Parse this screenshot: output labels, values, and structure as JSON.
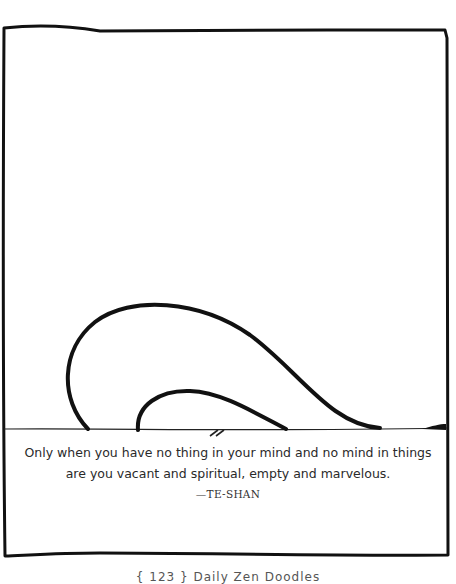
{
  "panel": {
    "quote_line_1": "Only when you have no thing in your mind and no mind in things",
    "quote_line_2": "are you vacant and spiritual, empty and marvelous.",
    "attribution": "—TE-SHAN"
  },
  "footer": {
    "text": "{ 123 } Daily Zen Doodles"
  },
  "colors": {
    "ink": "#111111",
    "text": "#2a2a2a",
    "background": "#ffffff"
  }
}
